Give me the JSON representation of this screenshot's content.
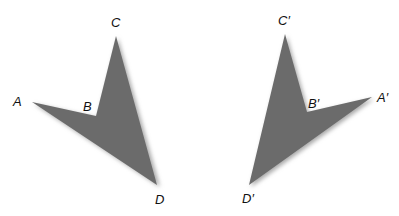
{
  "figure": {
    "fill_color": "#6b6b6b",
    "shadow_color": "#9a9a9a",
    "original": {
      "labels": {
        "A": "A",
        "B": "B",
        "C": "C",
        "D": "D"
      }
    },
    "image": {
      "labels": {
        "A": "A′",
        "B": "B′",
        "C": "C′",
        "D": "D′"
      }
    }
  }
}
